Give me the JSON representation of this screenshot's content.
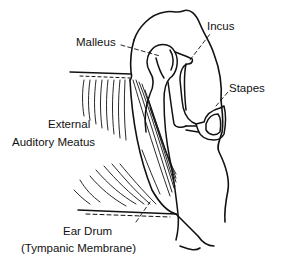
{
  "diagram": {
    "style": "black line art on white",
    "colors": {
      "background": "#ffffff",
      "ink": "#111111"
    },
    "labels": {
      "incus": "Incus",
      "malleus": "Malleus",
      "stapes": "Stapes",
      "external_line1": "External",
      "external_line2": "Auditory Meatus",
      "eardrum_line1": "Ear Drum",
      "eardrum_line2": "(Tympanic Membrane)"
    }
  }
}
